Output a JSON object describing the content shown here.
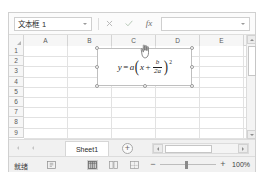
{
  "name_box": {
    "value": "文本框 1",
    "dropdown_icon": "chevron-down-icon"
  },
  "formula_bar": {
    "cancel_icon": "cancel-icon",
    "confirm_icon": "confirm-check-icon",
    "function_icon": "fx",
    "value": "",
    "placeholder": "",
    "expand_icon": "chevron-down-icon"
  },
  "grid": {
    "columns": [
      "A",
      "B",
      "C",
      "D",
      "E"
    ],
    "rows": [
      "1",
      "2",
      "3",
      "4",
      "5",
      "6",
      "7",
      "8",
      "9"
    ],
    "select_all_icon": "select-all-triangle-icon"
  },
  "shape": {
    "name": "文本框 1",
    "formula": {
      "lhs": "y",
      "equals": "=",
      "coefficient": "a",
      "inner_left": "x",
      "plus": "+",
      "numerator": "b",
      "denominator": "2a",
      "exponent": "2",
      "plain_text": "y = a(x + b/2a)²"
    },
    "handles": 8
  },
  "scrollbars": {
    "vertical": {
      "up_icon": "triangle-up-icon",
      "down_icon": "triangle-down-icon"
    },
    "horizontal": {
      "left_icon": "triangle-left-icon",
      "right_icon": "triangle-right-icon"
    }
  },
  "tabbar": {
    "nav_first_icon": "triangle-left-icon",
    "nav_prev_icon": "triangle-left-icon",
    "sheets": [
      "Sheet1"
    ],
    "active_sheet": "Sheet1",
    "add_sheet_label": "+"
  },
  "statusbar": {
    "status": "就绪",
    "status_icon": "accessibility-icon",
    "views": [
      {
        "name": "normal-view",
        "icon": "grid-view-icon",
        "active": true
      },
      {
        "name": "page-layout-view",
        "icon": "page-layout-icon",
        "active": false
      },
      {
        "name": "page-break-view",
        "icon": "page-break-icon",
        "active": false
      }
    ],
    "zoom_out_label": "−",
    "zoom_in_label": "+",
    "zoom_level": "100%"
  },
  "cursor": {
    "icon": "pointer-hand-icon"
  },
  "colors": {
    "window_border": "#d0d0d0",
    "header_bg": "#f6f6f6",
    "grid_line": "#e2e2e2",
    "handle_stroke": "#9a9a9a",
    "text": "#3a3a3a"
  }
}
